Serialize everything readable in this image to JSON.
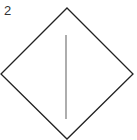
{
  "figure": {
    "label": "2",
    "shape": "diamond",
    "colors": {
      "outline": "#222222",
      "line": "#777777",
      "background": "#ffffff"
    },
    "diamond_vertices": {
      "top": [
        67,
        8
      ],
      "right": [
        133,
        74
      ],
      "bottom": [
        67,
        139
      ],
      "left": [
        1,
        74
      ]
    },
    "vertical_line": {
      "x": 66,
      "y1": 35,
      "y2": 119
    }
  }
}
